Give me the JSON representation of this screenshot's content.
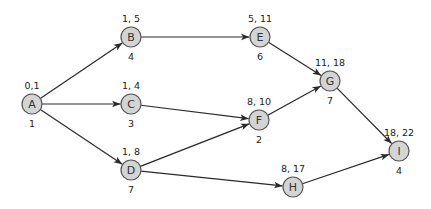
{
  "diagram": {
    "type": "activity-on-node network",
    "node_fill": "#d4d4d4",
    "node_stroke": "#555555",
    "edge_color": "#2a2a2a",
    "nodes": [
      {
        "id": "A",
        "x": 32,
        "y": 104,
        "times": "0,1",
        "duration": "1"
      },
      {
        "id": "B",
        "x": 131,
        "y": 37,
        "times": "1, 5",
        "duration": "4"
      },
      {
        "id": "C",
        "x": 131,
        "y": 104,
        "times": "1, 4",
        "duration": "3"
      },
      {
        "id": "D",
        "x": 131,
        "y": 170,
        "times": "1, 8",
        "duration": "7"
      },
      {
        "id": "E",
        "x": 260,
        "y": 37,
        "times": "5, 11",
        "duration": "6"
      },
      {
        "id": "F",
        "x": 259,
        "y": 120,
        "times": "8, 10",
        "duration": "2"
      },
      {
        "id": "G",
        "x": 330,
        "y": 81,
        "times": "11, 18",
        "duration": "7"
      },
      {
        "id": "H",
        "x": 293,
        "y": 187,
        "times": "8, 17",
        "duration": null
      },
      {
        "id": "I",
        "x": 399,
        "y": 151,
        "times": "18, 22",
        "duration": "4"
      }
    ],
    "edges": [
      {
        "from": "A",
        "to": "B"
      },
      {
        "from": "A",
        "to": "C"
      },
      {
        "from": "A",
        "to": "D"
      },
      {
        "from": "B",
        "to": "E"
      },
      {
        "from": "C",
        "to": "F"
      },
      {
        "from": "D",
        "to": "F"
      },
      {
        "from": "D",
        "to": "H"
      },
      {
        "from": "E",
        "to": "G"
      },
      {
        "from": "F",
        "to": "G"
      },
      {
        "from": "G",
        "to": "I"
      },
      {
        "from": "H",
        "to": "I"
      }
    ]
  }
}
